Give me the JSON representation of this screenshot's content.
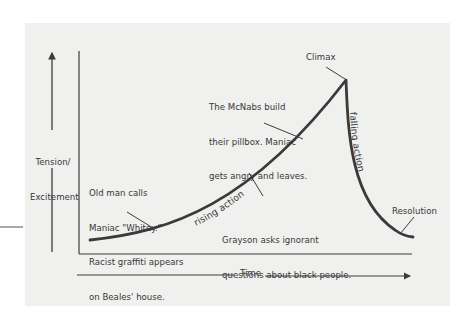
{
  "diagram": {
    "type": "plot-structure-curve",
    "y_axis_label": [
      "Tension/",
      "Excitement"
    ],
    "x_axis_label": "Time",
    "curve_labels": {
      "rising": "rising action",
      "falling": "falling action"
    },
    "points": {
      "climax": "Climax",
      "resolution": "Resolution"
    },
    "annotations": {
      "old_man": [
        "Old man calls",
        "Maniac \"Whitey.\"",
        "Racist graffiti appears",
        "on Beales' house."
      ],
      "mcnabs": [
        "The McNabs build",
        "their pillbox. Maniac",
        "gets angry and leaves."
      ],
      "grayson": [
        "Grayson asks ignorant",
        "questions about black people."
      ]
    },
    "colors": {
      "panel_background": "#f0f0ef",
      "line": "#3c3c3c",
      "text": "#383838"
    }
  }
}
